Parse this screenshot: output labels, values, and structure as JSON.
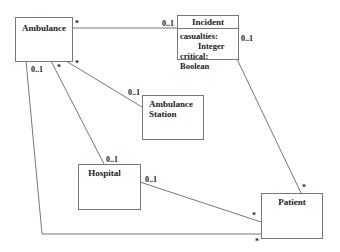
{
  "classes": {
    "ambulance": {
      "name": "Ambulance"
    },
    "incident": {
      "name": "Incident",
      "attributes": [
        "casualties:",
        "Integer",
        "critical: Boolean"
      ]
    },
    "ambulance_station": {
      "name_line1": "Ambulance",
      "name_line2": "Station"
    },
    "hospital": {
      "name": "Hospital"
    },
    "patient": {
      "name": "Patient"
    }
  },
  "associations": [
    {
      "from": "Ambulance",
      "to": "Incident",
      "from_mult": "*",
      "to_mult": "0..1"
    },
    {
      "from": "Ambulance",
      "to": "Ambulance Station",
      "from_mult": "*",
      "to_mult": "0..1"
    },
    {
      "from": "Ambulance",
      "to": "Hospital",
      "from_mult": "*",
      "to_mult": "0..1"
    },
    {
      "from": "Ambulance",
      "to": "Patient",
      "from_mult": "0..1",
      "to_mult": "*"
    },
    {
      "from": "Incident",
      "to": "Patient",
      "from_mult": "0..1",
      "to_mult": "*"
    },
    {
      "from": "Hospital",
      "to": "Patient",
      "from_mult": "0..1",
      "to_mult": "*"
    }
  ],
  "multiplicities": {
    "amb_inc_amb": "*",
    "amb_inc_inc": "0..1",
    "amb_sta_amb": "*",
    "amb_sta_sta": "0..1",
    "amb_hos_amb": "*",
    "amb_hos_hos": "0..1",
    "amb_pat_amb": "0..1",
    "amb_pat_pat": "*",
    "inc_pat_inc": "0..1",
    "inc_pat_pat": "*",
    "hos_pat_hos": "0..1",
    "hos_pat_pat": "*"
  }
}
